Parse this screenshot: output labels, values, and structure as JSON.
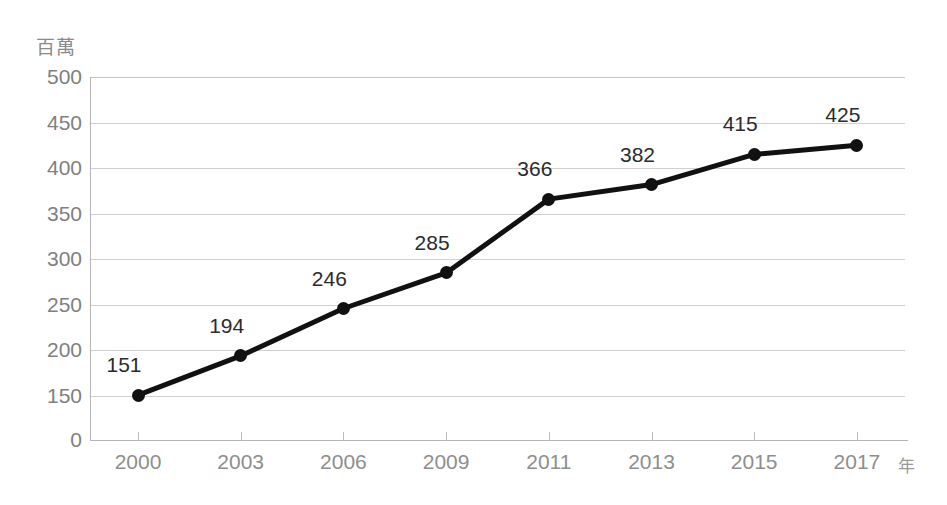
{
  "chart_data": {
    "type": "line",
    "title": "",
    "subtitle": "",
    "xlabel": "年",
    "ylabel": "百萬",
    "categories": [
      "2000",
      "2003",
      "2006",
      "2009",
      "2011",
      "2013",
      "2015",
      "2017"
    ],
    "values": [
      151,
      194,
      246,
      285,
      366,
      382,
      415,
      425
    ],
    "point_labels": [
      "151",
      "194",
      "246",
      "285",
      "366",
      "382",
      "415",
      "425"
    ],
    "series": [
      {
        "name": "",
        "values": [
          151,
          194,
          246,
          285,
          366,
          382,
          415,
          425
        ]
      }
    ],
    "ytick_labels": [
      "500",
      "450",
      "400",
      "350",
      "300",
      "250",
      "200",
      "150",
      "0"
    ],
    "ytick_values": [
      500,
      450,
      400,
      350,
      300,
      250,
      200,
      150,
      0
    ],
    "ylim": [
      0,
      500
    ],
    "axis_break": true,
    "axis_break_note": "y-axis compressed between 0 and 150",
    "grid": true,
    "legend": "none",
    "colors": {
      "line": "#111111",
      "marker": "#111111",
      "gridline": "#cfcfcf",
      "axis": "#b5b5b5",
      "tick_text": "#808080",
      "point_label_text": "#2b2b2b",
      "unit_label_text": "#8a8a8a",
      "background": "#ffffff"
    }
  }
}
